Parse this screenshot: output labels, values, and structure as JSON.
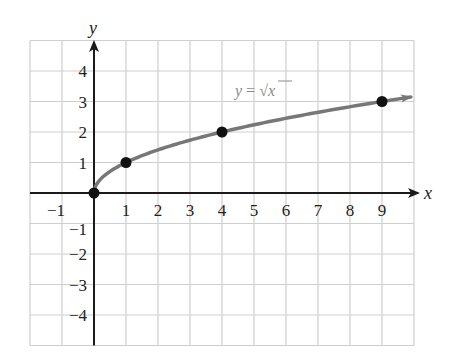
{
  "chart_data": {
    "type": "line",
    "title": "",
    "xlabel": "x",
    "ylabel": "y",
    "xlim": [
      -2,
      10
    ],
    "ylim": [
      -5,
      5
    ],
    "grid": true,
    "x_ticks": [
      -1,
      1,
      2,
      3,
      4,
      5,
      6,
      7,
      8,
      9
    ],
    "y_ticks": [
      -4,
      -3,
      -2,
      -1,
      1,
      2,
      3,
      4
    ],
    "x_tick_labels": [
      "−1",
      "1",
      "2",
      "3",
      "4",
      "5",
      "6",
      "7",
      "8",
      "9"
    ],
    "y_tick_labels": [
      "−4",
      "−3",
      "−2",
      "−1",
      "1",
      "2",
      "3",
      "4"
    ],
    "series": [
      {
        "name": "y = √x",
        "function": "sqrt",
        "domain": [
          0,
          9.9
        ],
        "color": "#777777",
        "arrow_end": true
      }
    ],
    "points": [
      {
        "x": 0,
        "y": 0
      },
      {
        "x": 1,
        "y": 1
      },
      {
        "x": 4,
        "y": 2
      },
      {
        "x": 9,
        "y": 3
      }
    ],
    "annotations": [
      {
        "text": "y = √x",
        "x": 5.5,
        "y": 3.2
      }
    ]
  },
  "labels": {
    "x_axis": "x",
    "y_axis": "y",
    "equation_prefix": "y = ",
    "equation_var": "x"
  },
  "colors": {
    "grid": "#cfcfcf",
    "axis": "#1a1a1a",
    "curve": "#777777",
    "point": "#111111",
    "equation": "#8a8a8a"
  }
}
